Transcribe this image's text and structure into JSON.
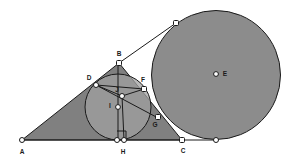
{
  "diagram": {
    "canvas": {
      "width": 300,
      "height": 165,
      "background": "#ffffff"
    },
    "colors": {
      "stroke": "#1a1a1a",
      "triangle_fill": "#808080",
      "incircle_fill": "#a0a0a0",
      "excircle_fill": "#8c8c8c",
      "vertex_fill": "#ffffff",
      "label_color": "#1a1a1a"
    },
    "points": [
      {
        "id": "A",
        "label": "A",
        "x": 22,
        "y": 140,
        "label_x": 22,
        "label_y": 152,
        "marker": "square"
      },
      {
        "id": "B",
        "label": "B",
        "x": 119,
        "y": 63,
        "label_x": 119,
        "label_y": 54,
        "marker": "square"
      },
      {
        "id": "C",
        "label": "C",
        "x": 182,
        "y": 140,
        "label_x": 183,
        "label_y": 151,
        "marker": "square"
      },
      {
        "id": "D",
        "label": "D",
        "x": 96,
        "y": 85,
        "label_x": 89,
        "label_y": 78,
        "marker": "square"
      },
      {
        "id": "F",
        "label": "F",
        "x": 144,
        "y": 89,
        "label_x": 143,
        "label_y": 80,
        "marker": "square"
      },
      {
        "id": "J",
        "label": "J",
        "x": 122,
        "y": 96,
        "label_x": 117,
        "label_y": 90,
        "marker": "square"
      },
      {
        "id": "G",
        "label": "G",
        "x": 158,
        "y": 117,
        "label_x": 155,
        "label_y": 125,
        "marker": "square"
      },
      {
        "id": "H",
        "label": "H",
        "x": 124,
        "y": 140,
        "label_x": 123,
        "label_y": 152,
        "marker": "square"
      },
      {
        "id": "H2",
        "label": "",
        "x": 117,
        "y": 140,
        "label_x": 0,
        "label_y": 0,
        "marker": "square"
      },
      {
        "id": "I",
        "label": "I",
        "x": 118,
        "y": 107,
        "label_x": 110,
        "label_y": 106,
        "marker": "circle"
      },
      {
        "id": "E",
        "label": "E",
        "x": 216,
        "y": 74,
        "label_x": 225,
        "label_y": 74,
        "marker": "circle"
      },
      {
        "id": "T1",
        "label": "",
        "x": 176,
        "y": 23,
        "label_x": 0,
        "label_y": 0,
        "marker": "square"
      },
      {
        "id": "T2",
        "label": "",
        "x": 216,
        "y": 140,
        "label_x": 0,
        "label_y": 0,
        "marker": "square"
      }
    ],
    "circles": [
      {
        "id": "incircle",
        "center_id": "I",
        "cx": 118,
        "cy": 107,
        "r": 33
      },
      {
        "id": "excircle",
        "center_id": "E",
        "cx": 216,
        "cy": 75,
        "r": 64.5
      }
    ],
    "polygons": [
      {
        "id": "triangle-abc",
        "vertices": "A,B,C"
      }
    ],
    "segments": [
      {
        "id": "seg-AC",
        "from": "A",
        "to": "C"
      },
      {
        "id": "seg-AB",
        "from": "A",
        "to": "B"
      },
      {
        "id": "seg-BC",
        "from": "B",
        "to": "C"
      },
      {
        "id": "seg-BH",
        "from": "B",
        "to": "H2"
      },
      {
        "id": "seg-DF",
        "from": "D",
        "to": "F"
      },
      {
        "id": "seg-DJ",
        "from": "D",
        "to": "J"
      },
      {
        "id": "seg-JF",
        "from": "J",
        "to": "F"
      },
      {
        "id": "seg-DG",
        "from": "D",
        "to": "G"
      },
      {
        "id": "seg-BT1",
        "from": "B",
        "to": "T1"
      },
      {
        "id": "seg-CE-base",
        "from": "C",
        "to": "T2"
      }
    ],
    "right_angle": {
      "id": "right-angle-at-H",
      "x": 117,
      "y": 131,
      "size": 8
    },
    "notes": {
      "axis_hint": "plain geometric figure, no axes or gridlines"
    }
  }
}
